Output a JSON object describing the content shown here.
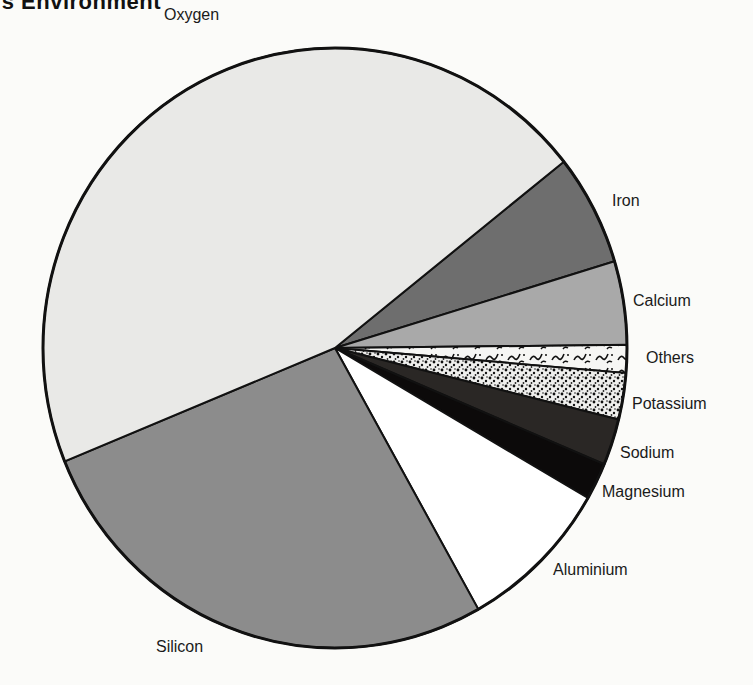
{
  "header": {
    "clipped_title": "'s Environment"
  },
  "chart_data": {
    "type": "pie",
    "title": "",
    "clipped_title_visible": "'s Environment",
    "legend": "none (direct labels)",
    "start_angle_deg": -38.4,
    "direction": "clockwise",
    "slices": [
      {
        "label": "Iron",
        "value": 6.0,
        "fill": "#6e6e6e",
        "pattern": "solid-dark-gray"
      },
      {
        "label": "Calcium",
        "value": 4.5,
        "fill": "#a9a9a9",
        "pattern": "solid-mid-gray"
      },
      {
        "label": "Others",
        "value": 1.5,
        "fill": "#f4f4f2",
        "pattern": "squiggles"
      },
      {
        "label": "Potassium",
        "value": 2.5,
        "fill": "#e6e6e6",
        "pattern": "dense-speckle"
      },
      {
        "label": "Sodium",
        "value": 2.5,
        "fill": "#2a2725",
        "pattern": "solid-very-dark"
      },
      {
        "label": "Magnesium",
        "value": 2.0,
        "fill": "#0c0a0a",
        "pattern": "solid-black"
      },
      {
        "label": "Aluminium",
        "value": 8.5,
        "fill": "#ffffff",
        "pattern": "solid-white"
      },
      {
        "label": "Silicon",
        "value": 27.0,
        "fill": "#8c8c8c",
        "pattern": "solid-gray"
      },
      {
        "label": "Oxygen",
        "value": 45.5,
        "fill": "#e9e9e7",
        "pattern": "solid-light-gray"
      }
    ],
    "categories": [
      "Iron",
      "Calcium",
      "Others",
      "Potassium",
      "Sodium",
      "Magnesium",
      "Aluminium",
      "Silicon",
      "Oxygen"
    ],
    "values": [
      6.0,
      4.5,
      1.5,
      2.5,
      2.5,
      2.0,
      8.5,
      27.0,
      45.5
    ],
    "units": "percent (estimated from slice angles)"
  },
  "labels": {
    "oxygen": "Oxygen",
    "iron": "Iron",
    "calcium": "Calcium",
    "others": "Others",
    "potassium": "Potassium",
    "sodium": "Sodium",
    "magnesium": "Magnesium",
    "aluminium": "Aluminium",
    "silicon": "Silicon"
  }
}
